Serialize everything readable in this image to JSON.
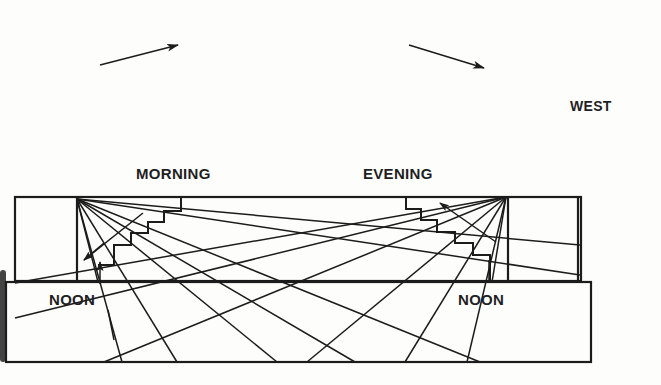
{
  "diagram": {
    "type": "sun-angle illustration",
    "labels": {
      "west": "WEST",
      "morning": "MORNING",
      "evening": "EVENING",
      "noon_left": "NOON",
      "noon_right": "NOON"
    },
    "arrows": [
      {
        "name": "sun-path-arrow-rising",
        "direction": "up-right"
      },
      {
        "name": "sun-path-arrow-setting",
        "direction": "down-right"
      }
    ],
    "colors": {
      "line": "#1c1c1c",
      "background": "#fdfdfc"
    }
  }
}
